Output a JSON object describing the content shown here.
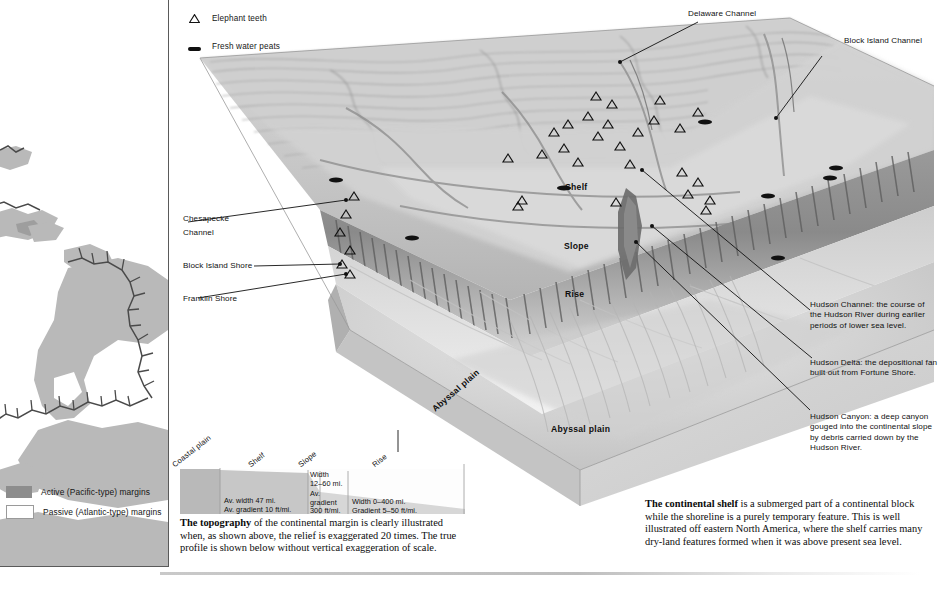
{
  "symbol_key": {
    "items": [
      {
        "icon": "triangle-outline-icon",
        "label": "Elephant teeth"
      },
      {
        "icon": "peat-bar-icon",
        "label": "Fresh water peats"
      }
    ]
  },
  "world_map": {
    "legend": [
      {
        "swatch_color": "#8d8d8d",
        "label": "Active (Pacific-type) margins"
      },
      {
        "swatch_color": "#ffffff",
        "label": "Passive (Atlantic-type) margins"
      }
    ]
  },
  "block_diagram": {
    "top_callouts": [
      {
        "name": "delaware-channel",
        "label": "Delaware Channel"
      },
      {
        "name": "block-island-channel",
        "label": "Block Island Channel"
      }
    ],
    "left_callouts": [
      {
        "name": "chesapeake-channel",
        "label": "Chesapecke\nChannel"
      },
      {
        "name": "block-island-shore",
        "label": "Block Island Shore"
      },
      {
        "name": "franklin-shore",
        "label": "Franklin Shore"
      }
    ],
    "left_callout_lines": [
      {
        "label": "Chesapecke"
      },
      {
        "label": "Channel"
      },
      {
        "label": "Block Island Shore"
      },
      {
        "label": "Franklin Shore"
      }
    ],
    "right_callouts": [
      {
        "name": "hudson-channel",
        "label": "Hudson Channel: the course of the Hudson River during earlier periods of lower sea level."
      },
      {
        "name": "hudson-delta",
        "label": "Hudson Delta: the depositional fan built out from Fortune Shore."
      },
      {
        "name": "hudson-canyon",
        "label": "Hudson Canyon: a deep canyon gouged into the continental slope by debris carried down by the Hudson River."
      }
    ],
    "terrain_labels": [
      {
        "name": "shelf",
        "label": "Shelf"
      },
      {
        "name": "slope",
        "label": "Slope"
      },
      {
        "name": "rise",
        "label": "Rise"
      },
      {
        "name": "abyssal-plain",
        "label": "Abyssal plain"
      },
      {
        "name": "abyssal-plain-side",
        "label": "Abyssal plain"
      }
    ]
  },
  "profile": {
    "headers": [
      {
        "name": "coastal-plain",
        "label": "Coastal plain"
      },
      {
        "name": "shelf",
        "label": "Shelf"
      },
      {
        "name": "slope",
        "label": "Slope"
      },
      {
        "name": "rise",
        "label": "Rise"
      }
    ],
    "cells": {
      "shelf_width": "Av. width 47 mi.",
      "shelf_gradient": "Av. gradient 10 ft/mi.",
      "slope_width_l1": "Width",
      "slope_width_l2": "12–60 mi.",
      "slope_grad_l1": "Av.",
      "slope_grad_l2": "gradient",
      "slope_grad_l3": "300 ft/mi.",
      "rise_width": "Width 0–400 mi.",
      "rise_gradient": "Gradient 5–50 ft/mi."
    }
  },
  "captions": {
    "topography_lead": "The topography",
    "topography_body": " of the continental margin is clearly illustrated when, as shown above, the relief is exaggerated 20 times. The true profile is shown below without vertical exaggeration of scale.",
    "shelf_lead": "The continental shelf",
    "shelf_body": " is a submerged part of a continental block while the shoreline is a purely temporary feature. This is well illustrated off eastern North America, where the shelf carries many dry-land features formed when it was above present sea level."
  }
}
